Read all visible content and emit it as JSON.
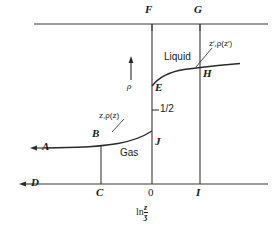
{
  "figure": {
    "type": "thermodynamic-phase-diagram",
    "background": "#ffffff",
    "line_color": "#3a3a3a",
    "text_color": "#1a1a1a"
  },
  "axes": {
    "x_axis_label_prefix": "ln",
    "x_axis_label_numerator": "z",
    "x_axis_label_denominator": "ӡ",
    "y_axis_symbol": "ρ",
    "x_ticks": [
      {
        "id": "C",
        "label": "C",
        "x_px": 101
      },
      {
        "id": "0",
        "label": "0",
        "x_px": 152
      },
      {
        "id": "I",
        "label": "I",
        "x_px": 200
      }
    ],
    "y_ticks": [
      {
        "label": "1/2",
        "y_px": 110
      }
    ]
  },
  "points": [
    {
      "id": "A",
      "label": "A",
      "note": "gas branch far-left, arrow continues left"
    },
    {
      "id": "B",
      "label": "B",
      "note": "gas branch at x = C"
    },
    {
      "id": "C",
      "label": "C",
      "note": "bottom axis tick below B"
    },
    {
      "id": "D",
      "label": "D",
      "note": "bottom axis left, arrow continues left"
    },
    {
      "id": "E",
      "label": "E",
      "note": "liquid branch lower end at x = 0"
    },
    {
      "id": "F",
      "label": "F",
      "note": "top line tick above E, at x = 0"
    },
    {
      "id": "G",
      "label": "G",
      "note": "top line tick above H, at x = I"
    },
    {
      "id": "H",
      "label": "H",
      "note": "liquid branch at x = I"
    },
    {
      "id": "I",
      "label": "I",
      "note": "bottom axis tick below H"
    },
    {
      "id": "J",
      "label": "J",
      "note": "gas branch upper end at x = 0"
    }
  ],
  "region_labels": [
    {
      "id": "gas",
      "text": "Gas"
    },
    {
      "id": "liquid",
      "text": "Liquid"
    }
  ],
  "annotations": [
    {
      "id": "gas-state",
      "text": "z,ρ(z)",
      "leader": "points to gas curve near B"
    },
    {
      "id": "liquid-state",
      "text": "z′,ρ(z′)",
      "leader": "points to liquid curve near H"
    }
  ],
  "arrows": [
    {
      "id": "rho-arrow",
      "direction": "up",
      "meaning": "density axis direction"
    },
    {
      "id": "A-arrow",
      "direction": "left"
    },
    {
      "id": "D-arrow",
      "direction": "left"
    }
  ]
}
